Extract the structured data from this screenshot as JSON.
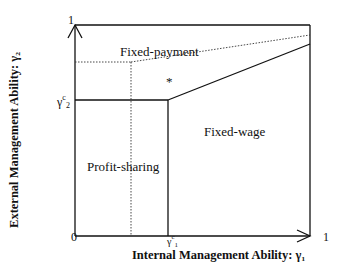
{
  "diagram": {
    "axes": {
      "x_label": "Internal Management Ability: γ₁",
      "y_label": "External Management Ability: γ₂",
      "origin_label": "0",
      "x_max_label": "1",
      "y_max_label": "1",
      "x_threshold_label": "γ",
      "x_threshold_sup": "c",
      "x_threshold_sub": "1",
      "y_threshold_label": "γ",
      "y_threshold_sup": "c",
      "y_threshold_sub": "2"
    },
    "regions": [
      {
        "name": "fixed-payment",
        "label": "Fixed-payment"
      },
      {
        "name": "fixed-wage",
        "label": "Fixed-wage"
      },
      {
        "name": "profit-sharing",
        "label": "Profit-sharing"
      }
    ],
    "marker": "*",
    "colors": {
      "line": "#111111",
      "background": "#ffffff"
    }
  }
}
